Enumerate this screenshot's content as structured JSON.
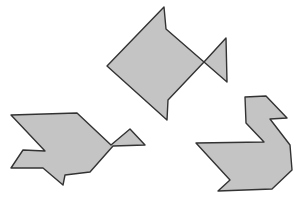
{
  "figure": {
    "shapes": [
      {
        "name": "fish",
        "points": "107,66 164,7 166,29 204,62 226,38 227,82 204,62 168,100 167,120"
      },
      {
        "name": "bird",
        "points": "11,115 77,113 111,145 130,129 145,145 113,146 90,172 65,175 63,185 43,168 11,168 23,150 45,151"
      },
      {
        "name": "swan",
        "points": "245,97 266,96 287,118 270,119 290,145 292,170 272,189 218,191 230,180 196,143 264,142 246,123"
      }
    ],
    "fill": "#c4c4c4",
    "stroke": "#333333"
  }
}
